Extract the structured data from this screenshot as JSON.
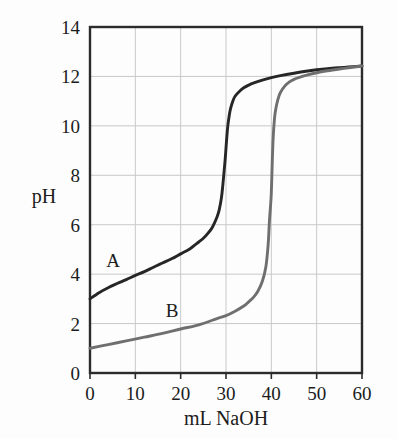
{
  "chart_data": {
    "type": "line",
    "title": "",
    "xlabel": "mL NaOH",
    "ylabel": "pH",
    "xlim": [
      0,
      60
    ],
    "ylim": [
      0,
      14
    ],
    "xticks": [
      "0",
      "10",
      "20",
      "30",
      "40",
      "50",
      "60"
    ],
    "xtick_values": [
      0,
      10,
      20,
      30,
      40,
      50,
      60
    ],
    "yticks": [
      "0",
      "2",
      "4",
      "6",
      "8",
      "10",
      "12",
      "14"
    ],
    "ytick_values": [
      0,
      2,
      4,
      6,
      8,
      10,
      12,
      14
    ],
    "grid": true,
    "grid_color": "#c9c9c9",
    "frame_color": "#2b2b2b",
    "legend": "inline-labels",
    "series": [
      {
        "name": "A",
        "label": "A",
        "color": "#262626",
        "equivalence_volume": 30,
        "equivalence_ph": 8.7,
        "x": [
          0,
          2,
          4,
          6,
          8,
          10,
          12,
          14,
          16,
          18,
          20,
          22,
          24,
          25,
          26,
          27,
          28,
          28.5,
          29,
          29.3,
          29.6,
          29.8,
          30,
          30.2,
          30.4,
          30.7,
          31,
          31.5,
          32,
          33,
          34,
          35,
          36,
          38,
          40,
          42,
          45,
          48,
          50,
          54,
          57,
          60
        ],
        "y": [
          3.0,
          3.25,
          3.45,
          3.62,
          3.78,
          3.95,
          4.1,
          4.28,
          4.45,
          4.62,
          4.82,
          5.02,
          5.3,
          5.45,
          5.65,
          5.9,
          6.3,
          6.6,
          7.1,
          7.6,
          8.2,
          8.6,
          9.1,
          9.6,
          10.0,
          10.4,
          10.7,
          11.0,
          11.2,
          11.4,
          11.55,
          11.65,
          11.73,
          11.85,
          11.95,
          12.03,
          12.13,
          12.22,
          12.27,
          12.34,
          12.38,
          12.42
        ]
      },
      {
        "name": "B",
        "label": "B",
        "color": "#6f6f6f",
        "equivalence_volume": 40,
        "equivalence_ph": 7.0,
        "x": [
          0,
          4,
          8,
          12,
          16,
          20,
          24,
          28,
          30,
          32,
          34,
          35,
          36,
          37,
          38,
          38.8,
          39.3,
          39.6,
          39.8,
          40,
          40.2,
          40.4,
          40.7,
          41,
          41.5,
          42,
          43,
          44,
          45,
          46,
          48,
          50,
          52,
          55,
          57,
          60
        ],
        "y": [
          1.0,
          1.15,
          1.3,
          1.45,
          1.6,
          1.78,
          1.95,
          2.2,
          2.32,
          2.5,
          2.72,
          2.88,
          3.05,
          3.3,
          3.7,
          4.3,
          5.2,
          6.2,
          6.7,
          7.3,
          8.5,
          9.5,
          10.3,
          10.7,
          11.1,
          11.35,
          11.62,
          11.78,
          11.88,
          11.95,
          12.06,
          12.15,
          12.22,
          12.3,
          12.35,
          12.42
        ]
      }
    ]
  },
  "labels": {
    "curve_a": "A",
    "curve_b": "B",
    "y_axis_title": "pH",
    "x_axis_title": "mL NaOH"
  }
}
